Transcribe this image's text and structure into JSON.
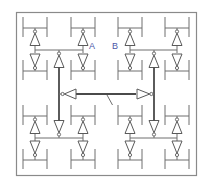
{
  "diagram": {
    "labels": {
      "a": "A",
      "b": "B"
    },
    "colors": {
      "label": "#4b57a8",
      "thin_wire": "#6e6e6e",
      "thick_wire": "#4a4a4a",
      "frame": "#8a8a8a"
    },
    "quadrants": [
      "top-left",
      "top-right",
      "bottom-left",
      "bottom-right"
    ],
    "center_bus": {
      "left_buffer_direction": "left",
      "right_buffer_direction": "right"
    }
  }
}
